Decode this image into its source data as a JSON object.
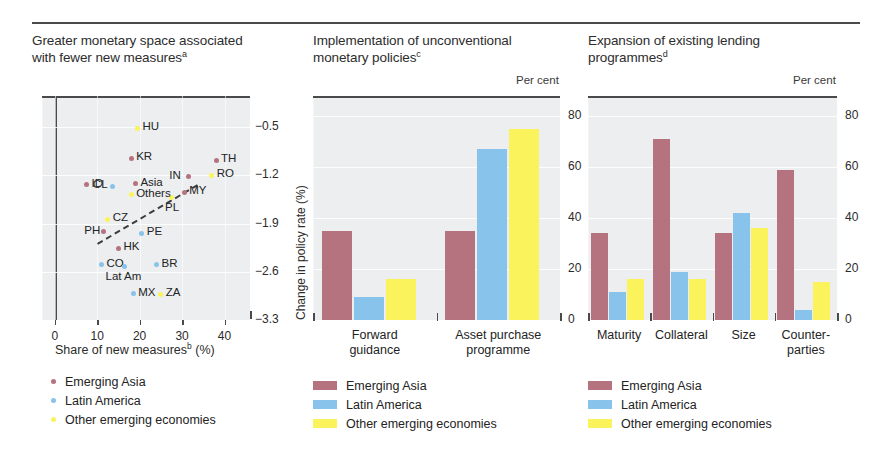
{
  "colors": {
    "emerging_asia": "#b5737f",
    "latin_america": "#87c3ea",
    "other_emerging": "#fbf35c",
    "plot_bg": "#eceef0",
    "axis": "#4a4a4a",
    "text": "#2b2b2b"
  },
  "legend": {
    "emerging_asia": "Emerging Asia",
    "latin_america": "Latin America",
    "other_emerging": "Other emerging economies"
  },
  "panels": {
    "left": {
      "title_line1": "Greater monetary space associated",
      "title_line2": "with fewer new measures",
      "title_sup": "a",
      "xlabel_text": "Share of new measures",
      "xlabel_sup": "b",
      "xlabel_unit": "(%)",
      "ylabel": "Change in policy rate (%)"
    },
    "middle": {
      "title_line1": "Implementation of unconventional",
      "title_line2": "monetary policies",
      "title_sup": "c",
      "unit": "Per cent"
    },
    "right": {
      "title_line1": "Expansion of existing lending",
      "title_line2": "programmes",
      "title_sup": "d",
      "unit": "Per cent"
    }
  },
  "chart_data": [
    {
      "type": "scatter",
      "title": "Greater monetary space associated with fewer new measures",
      "xlabel": "Share of new measures (%)",
      "ylabel": "Change in policy rate (%)",
      "xlim": [
        -3,
        46
      ],
      "ylim": [
        -3.3,
        -0.05
      ],
      "xticks": [
        0,
        10,
        20,
        30,
        40
      ],
      "yticks": [
        -0.5,
        -1.2,
        -1.9,
        -2.6,
        -3.3
      ],
      "grid": true,
      "trendline": {
        "x1": 10.0,
        "y1": -2.18,
        "x2": 33.5,
        "y2": -1.33,
        "style": "dashed"
      },
      "series": [
        {
          "name": "Emerging Asia",
          "color": "#b5737f",
          "points": [
            {
              "label": "KR",
              "x": 18.0,
              "y": -0.95,
              "label_pos": "right"
            },
            {
              "label": "TH",
              "x": 38.0,
              "y": -0.98,
              "label_pos": "right"
            },
            {
              "label": "ID",
              "x": 7.5,
              "y": -1.34,
              "label_pos": "right"
            },
            {
              "label": "IN",
              "x": 31.5,
              "y": -1.22,
              "label_pos": "left"
            },
            {
              "label": "MY",
              "x": 30.5,
              "y": -1.45,
              "label_pos": "right"
            },
            {
              "label": "PH",
              "x": 11.5,
              "y": -2.02,
              "label_pos": "left"
            },
            {
              "label": "HK",
              "x": 15.0,
              "y": -2.26,
              "label_pos": "right"
            },
            {
              "label": "Asia",
              "x": 19.0,
              "y": -1.32,
              "label_pos": "right"
            }
          ]
        },
        {
          "name": "Latin America",
          "color": "#87c3ea",
          "points": [
            {
              "label": "CL",
              "x": 13.5,
              "y": -1.36,
              "label_pos": "left"
            },
            {
              "label": "PE",
              "x": 20.5,
              "y": -2.04,
              "label_pos": "right"
            },
            {
              "label": "CO",
              "x": 11.0,
              "y": -2.5,
              "label_pos": "right"
            },
            {
              "label": "BR",
              "x": 24.0,
              "y": -2.5,
              "label_pos": "right"
            },
            {
              "label": "MX",
              "x": 18.5,
              "y": -2.92,
              "label_pos": "right"
            },
            {
              "label": "Lat Am",
              "x": 16.5,
              "y": -2.52,
              "label_pos": "below"
            }
          ]
        },
        {
          "name": "Other emerging economies",
          "color": "#fbf35c",
          "points": [
            {
              "label": "HU",
              "x": 19.5,
              "y": -0.52,
              "label_pos": "right"
            },
            {
              "label": "RO",
              "x": 37.0,
              "y": -1.2,
              "label_pos": "right"
            },
            {
              "label": "CZ",
              "x": 12.5,
              "y": -1.84,
              "label_pos": "right"
            },
            {
              "label": "PL",
              "x": 27.5,
              "y": -1.52,
              "label_pos": "below"
            },
            {
              "label": "ZA",
              "x": 25.0,
              "y": -2.93,
              "label_pos": "right"
            },
            {
              "label": "Others",
              "x": 18.0,
              "y": -1.48,
              "label_pos": "right"
            }
          ]
        }
      ]
    },
    {
      "type": "bar",
      "title": "Implementation of unconventional monetary policies",
      "unit": "Per cent",
      "categories": [
        "Forward guidance",
        "Asset purchase programme"
      ],
      "category_lines": [
        [
          "Forward",
          "guidance"
        ],
        [
          "Asset purchase",
          "programme"
        ]
      ],
      "yticks": [
        0,
        20,
        40,
        60,
        80
      ],
      "ylim": [
        0,
        88
      ],
      "grid": true,
      "series": [
        {
          "name": "Emerging Asia",
          "color": "#b5737f",
          "values": [
            35,
            35
          ]
        },
        {
          "name": "Latin America",
          "color": "#87c3ea",
          "values": [
            9,
            67
          ]
        },
        {
          "name": "Other emerging economies",
          "color": "#fbf35c",
          "values": [
            16,
            75
          ]
        }
      ]
    },
    {
      "type": "bar",
      "title": "Expansion of existing lending programmes",
      "unit": "Per cent",
      "categories": [
        "Maturity",
        "Collateral",
        "Size",
        "Counter-parties"
      ],
      "category_lines": [
        [
          "Maturity"
        ],
        [
          "Collateral"
        ],
        [
          "Size"
        ],
        [
          "Counter-",
          "parties"
        ]
      ],
      "yticks": [
        0,
        20,
        40,
        60,
        80
      ],
      "ylim": [
        0,
        88
      ],
      "grid": true,
      "series": [
        {
          "name": "Emerging Asia",
          "color": "#b5737f",
          "values": [
            34,
            71,
            34,
            59
          ]
        },
        {
          "name": "Latin America",
          "color": "#87c3ea",
          "values": [
            11,
            19,
            42,
            4
          ]
        },
        {
          "name": "Other emerging economies",
          "color": "#fbf35c",
          "values": [
            16,
            16,
            36,
            15
          ]
        }
      ]
    }
  ]
}
